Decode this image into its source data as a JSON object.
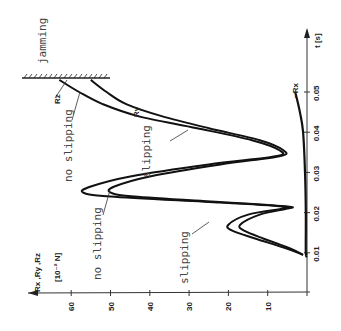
{
  "chart_data": {
    "type": "line",
    "orientation": "rotated 90deg: force axis horizontal (bottom, increasing leftward), time axis vertical (right, increasing upward)",
    "title": "",
    "xlabel": "t [s]",
    "ylabel": "Rx, Ry, Rz [10^-2 N]",
    "xlim": [
      0,
      0.055
    ],
    "ylim": [
      0,
      65
    ],
    "x_ticks": [
      "0.01",
      "0.02",
      "0.03",
      "0.04",
      "0.05"
    ],
    "y_ticks": [
      "10",
      "20",
      "30",
      "40",
      "50",
      "60"
    ],
    "grid": false,
    "series": [
      {
        "name": "Rz",
        "t": [
          0.0095,
          0.011,
          0.0135,
          0.0155,
          0.017,
          0.0195,
          0.021,
          0.0215,
          0.0225,
          0.024,
          0.025,
          0.0265,
          0.029,
          0.032,
          0.034,
          0.0355,
          0.038,
          0.041,
          0.044,
          0.047,
          0.05,
          0.053
        ],
        "values": [
          1,
          5,
          13,
          19,
          20,
          15,
          6,
          6,
          22,
          50,
          57,
          55,
          45,
          25,
          8,
          7,
          14,
          28,
          43,
          52,
          58,
          63
        ]
      },
      {
        "name": "Ry",
        "t": [
          0.0095,
          0.011,
          0.0135,
          0.0155,
          0.017,
          0.0195,
          0.021,
          0.0215,
          0.0225,
          0.024,
          0.025,
          0.0265,
          0.029,
          0.032,
          0.034,
          0.0355,
          0.038,
          0.041,
          0.044,
          0.047,
          0.05,
          0.053
        ],
        "values": [
          1,
          4,
          11,
          16,
          17,
          12,
          5,
          5,
          20,
          44,
          50,
          49,
          40,
          22,
          7,
          6,
          12,
          25,
          37,
          46,
          51,
          55
        ]
      },
      {
        "name": "-Rx",
        "t": [
          0.0095,
          0.01,
          0.02,
          0.03,
          0.04,
          0.045,
          0.05
        ],
        "values": [
          0,
          0.3,
          0.3,
          0.5,
          1.0,
          1.8,
          3.0
        ]
      }
    ],
    "annotations": [
      {
        "text": "jamming",
        "near_t": 0.054,
        "near_value": 62
      },
      {
        "text": "no slipping",
        "near_t": 0.04,
        "near_value": 58
      },
      {
        "text": "slipping",
        "near_t": 0.035,
        "near_value": 40
      },
      {
        "text": "no slipping",
        "near_t": 0.02,
        "near_value": 53
      },
      {
        "text": "slipping",
        "near_t": 0.018,
        "near_value": 30
      }
    ],
    "legend": [
      "Rz",
      "Ry",
      "-Rx"
    ]
  },
  "labels": {
    "y_axis_line1": "Rx ,Ry ,Rz",
    "y_axis_line2": "[10⁻² N]",
    "t_axis": "t [s]",
    "jamming": "jamming",
    "no_slipping_top": "no slipping",
    "slipping_top": "slipping",
    "no_slipping_bottom": "no slipping",
    "slipping_bottom": "slipping",
    "rz": "Rz",
    "ry": "Ry",
    "rx": "−Rx"
  }
}
